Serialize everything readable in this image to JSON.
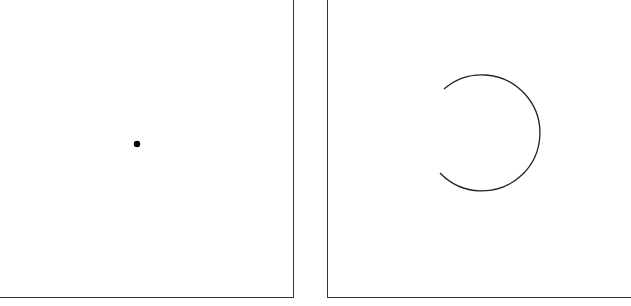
{
  "figure": {
    "panels": [
      {
        "id": "left",
        "content": "dot",
        "dot": {
          "cx": 137,
          "cy": 144,
          "r": 3.2,
          "color": "#000000"
        }
      },
      {
        "id": "right",
        "content": "open-arc",
        "arc": {
          "cx": 483,
          "cy": 132,
          "r": 58,
          "start": {
            "x": 444,
            "y": 89
          },
          "end": {
            "x": 440,
            "y": 173
          },
          "color": "#222222",
          "gap_side": "left"
        }
      }
    ],
    "border_color": "#333333"
  }
}
